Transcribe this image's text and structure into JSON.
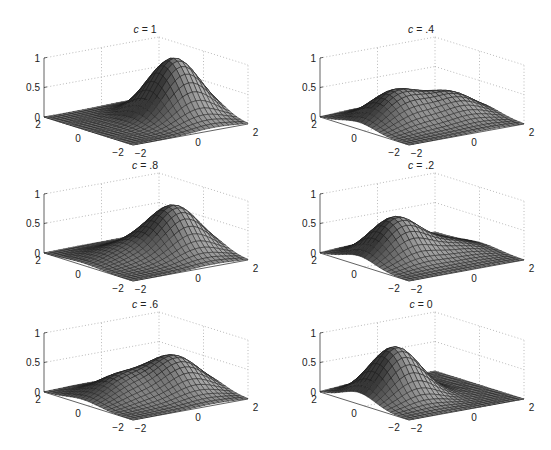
{
  "chart_data": {
    "type": "surface",
    "title": "",
    "layout": "3 rows x 2 columns of 3D mesh surface plots",
    "xlabel": "",
    "ylabel": "",
    "zlabel": "",
    "x_axis": {
      "range": [
        -2,
        2
      ],
      "ticks": [
        -2,
        0,
        2
      ],
      "tick_labels": [
        "−2",
        "0",
        "2"
      ]
    },
    "y_axis": {
      "range": [
        -2,
        2
      ],
      "ticks": [
        -2,
        0,
        2
      ],
      "tick_labels": [
        "−2",
        "0",
        "2"
      ]
    },
    "z_axis": {
      "range": [
        0,
        1
      ],
      "ticks": [
        0,
        0.5,
        1
      ],
      "tick_labels": [
        "0",
        "0.5",
        "1"
      ]
    },
    "grid": true,
    "grid_style": "dotted",
    "mesh_intervals": 24,
    "surface_model": "z = c·G1(x,y) + (1 − c)·G2(x,y)",
    "components": [
      {
        "name": "G1",
        "center": [
          0.85,
          -0.15
        ],
        "peak": 1.0,
        "sigma": 0.75
      },
      {
        "name": "G2",
        "center": [
          -0.75,
          0.25
        ],
        "peak": 0.86,
        "sigma": 0.73
      }
    ],
    "panels": [
      {
        "title": "c = 1",
        "c_symbol": "c",
        "c_text": "= 1",
        "c": 1.0,
        "row": 0,
        "col": 0,
        "peaks": [
          {
            "x": 0.85,
            "y": -0.15,
            "z": 1.0
          }
        ]
      },
      {
        "title": "c = .4",
        "c_symbol": "c",
        "c_text": "= .4",
        "c": 0.4,
        "row": 0,
        "col": 1,
        "peaks": [
          {
            "x": -0.75,
            "y": 0.25,
            "z": 0.52
          },
          {
            "x": 0.85,
            "y": -0.15,
            "z": 0.42
          }
        ]
      },
      {
        "title": "c = .8",
        "c_symbol": "c",
        "c_text": "= .8",
        "c": 0.8,
        "row": 1,
        "col": 0,
        "peaks": [
          {
            "x": 0.85,
            "y": -0.15,
            "z": 0.8
          },
          {
            "x": -0.75,
            "y": 0.25,
            "z": 0.19
          }
        ]
      },
      {
        "title": "c = .2",
        "c_symbol": "c",
        "c_text": "= .2",
        "c": 0.2,
        "row": 1,
        "col": 1,
        "peaks": [
          {
            "x": -0.75,
            "y": 0.25,
            "z": 0.69
          },
          {
            "x": 0.85,
            "y": -0.15,
            "z": 0.22
          }
        ]
      },
      {
        "title": "c = .6",
        "c_symbol": "c",
        "c_text": "= .6",
        "c": 0.6,
        "row": 2,
        "col": 0,
        "peaks": [
          {
            "x": 0.85,
            "y": -0.15,
            "z": 0.6
          },
          {
            "x": -0.75,
            "y": 0.25,
            "z": 0.36
          }
        ]
      },
      {
        "title": "c = 0",
        "c_symbol": "c",
        "c_text": "= 0",
        "c": 0.0,
        "row": 2,
        "col": 1,
        "peaks": [
          {
            "x": -0.75,
            "y": 0.25,
            "z": 0.86
          }
        ]
      }
    ]
  }
}
